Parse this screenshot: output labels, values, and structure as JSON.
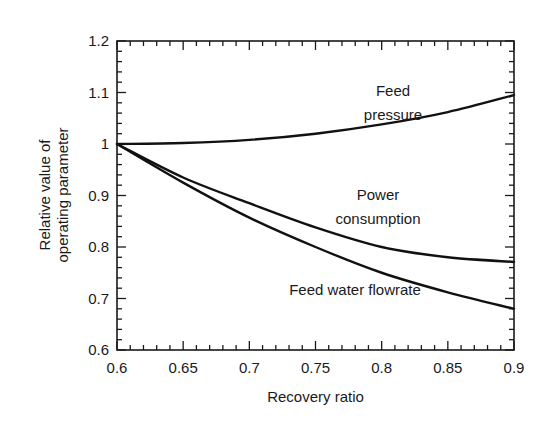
{
  "chart_data": {
    "type": "line",
    "title": "",
    "xlabel": "Recovery ratio",
    "ylabel_lines": [
      "Relative value of",
      "operating parameter"
    ],
    "ylabel": "Relative value of operating parameter",
    "xlim": [
      0.6,
      0.9
    ],
    "ylim": [
      0.6,
      1.2
    ],
    "xticks": [
      "0.6",
      "0.65",
      "0.7",
      "0.75",
      "0.8",
      "0.85",
      "0.9"
    ],
    "yticks": [
      "0.6",
      "0.7",
      "0.8",
      "0.9",
      "1",
      "1.1",
      "1.2"
    ],
    "grid": false,
    "legend": "none (inline annotations)",
    "x": [
      0.6,
      0.65,
      0.7,
      0.75,
      0.8,
      0.85,
      0.9
    ],
    "series": [
      {
        "name": "Feed pressure",
        "label_lines": [
          "Feed",
          "pressure"
        ],
        "values": [
          1.0,
          1.002,
          1.008,
          1.02,
          1.038,
          1.062,
          1.095
        ]
      },
      {
        "name": "Power consumption",
        "label_lines": [
          "Power",
          "consumption"
        ],
        "values": [
          1.0,
          0.935,
          0.885,
          0.838,
          0.8,
          0.78,
          0.771
        ]
      },
      {
        "name": "Feed water flowrate",
        "label_lines": [
          "Feed water flowrate"
        ],
        "values": [
          1.0,
          0.925,
          0.857,
          0.8,
          0.75,
          0.712,
          0.68
        ]
      }
    ]
  },
  "plot": {
    "left": 117,
    "right": 514,
    "top": 41,
    "bottom": 350
  },
  "colors": {
    "line": "#111111",
    "axis": "#1a1a1a",
    "background": "#ffffff"
  },
  "annotations": [
    {
      "series": 0,
      "x": 393,
      "lines_y": [
        96,
        120
      ]
    },
    {
      "series": 1,
      "x": 378,
      "lines_y": [
        200,
        224
      ]
    },
    {
      "series": 2,
      "x": 355,
      "lines_y": [
        295
      ]
    }
  ]
}
